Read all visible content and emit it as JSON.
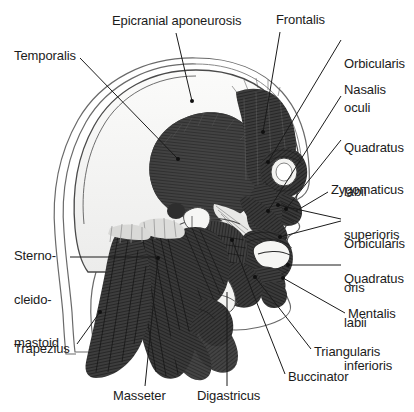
{
  "figure": {
    "view": "lateral",
    "background_color": "#ffffff",
    "ink_color": "#1b1b1b",
    "muscle_fill_dark": "#3a3a3a",
    "muscle_fill_mid": "#6e6e6e",
    "bone_fill": "#f2f2f0",
    "skin_outline_color": "#5a5a5a"
  },
  "labels": [
    {
      "id": "epicranial-aponeurosis",
      "text": "Epicranial aponeurosis",
      "lines": [
        "Epicranial aponeurosis"
      ],
      "x": 112,
      "y": 14,
      "align": "left",
      "leader": {
        "x1": 176,
        "y1": 33,
        "x2": 192,
        "y2": 101
      }
    },
    {
      "id": "frontalis",
      "text": "Frontalis",
      "lines": [
        "Frontalis"
      ],
      "x": 276,
      "y": 13,
      "align": "left",
      "leader": {
        "x1": 280,
        "y1": 32,
        "x2": 263,
        "y2": 132
      }
    },
    {
      "id": "orbicularis-oculi",
      "text": "Orbicularis oculi",
      "lines": [
        "Orbicularis",
        "oculi"
      ],
      "x": 344,
      "y": 28,
      "align": "left",
      "leader": {
        "x1": 341,
        "y1": 40,
        "x2": 268,
        "y2": 162
      }
    },
    {
      "id": "nasalis",
      "text": "Nasalis",
      "lines": [
        "Nasalis"
      ],
      "x": 344,
      "y": 83,
      "align": "left",
      "leader": {
        "x1": 341,
        "y1": 96,
        "x2": 268,
        "y2": 211
      }
    },
    {
      "id": "quadratus-labii-superioris",
      "text": "Quadratus labii superioris",
      "lines": [
        "Quadratus",
        "labii",
        "superioris"
      ],
      "x": 344,
      "y": 112,
      "align": "left",
      "leader": {
        "x1": 341,
        "y1": 140,
        "x2": 286,
        "y2": 209
      }
    },
    {
      "id": "zygomaticus",
      "text": "Zygomaticus",
      "lines": [
        "Zygomaticus"
      ],
      "x": 331,
      "y": 183,
      "align": "left",
      "leader": {
        "x1": 328,
        "y1": 192,
        "x2": 296,
        "y2": 211
      }
    },
    {
      "id": "orbicularis-oris",
      "text": "Orbicularis oris",
      "lines": [
        "Orbicularis",
        "oris"
      ],
      "x": 344,
      "y": 208,
      "align": "left",
      "leader": {
        "x1": 341,
        "y1": 220,
        "x2": 278,
        "y2": 205
      },
      "leader2": {
        "x1": 341,
        "y1": 222,
        "x2": 280,
        "y2": 236
      }
    },
    {
      "id": "quadratus-labii-inferioris",
      "text": "Quadratus labii inferioris",
      "lines": [
        "Quadratus",
        "labii",
        "inferioris"
      ],
      "x": 344,
      "y": 243,
      "align": "left",
      "leader": {
        "x1": 341,
        "y1": 265,
        "x2": 288,
        "y2": 265
      }
    },
    {
      "id": "mentalis",
      "text": "Mentalis",
      "lines": [
        "Mentalis"
      ],
      "x": 348,
      "y": 307,
      "align": "left",
      "leader": {
        "x1": 345,
        "y1": 315,
        "x2": 283,
        "y2": 278
      }
    },
    {
      "id": "triangularis",
      "text": "Triangularis",
      "lines": [
        "Triangularis"
      ],
      "x": 314,
      "y": 345,
      "align": "left",
      "leader": {
        "x1": 311,
        "y1": 351,
        "x2": 255,
        "y2": 277
      }
    },
    {
      "id": "buccinator",
      "text": "Buccinator",
      "lines": [
        "Buccinator"
      ],
      "x": 288,
      "y": 370,
      "align": "left",
      "leader": {
        "x1": 285,
        "y1": 376,
        "x2": 232,
        "y2": 240
      }
    },
    {
      "id": "digastricus",
      "text": "Digastricus",
      "lines": [
        "Digastricus"
      ],
      "x": 197,
      "y": 389,
      "align": "left",
      "leader": {
        "x1": 227,
        "y1": 388,
        "x2": 227,
        "y2": 292
      }
    },
    {
      "id": "masseter",
      "text": "Masseter",
      "lines": [
        "Masseter"
      ],
      "x": 113,
      "y": 389,
      "align": "left",
      "leader": {
        "x1": 145,
        "y1": 386,
        "x2": 158,
        "y2": 258
      }
    },
    {
      "id": "trapezius",
      "text": "Trapezius",
      "lines": [
        "Trapezius"
      ],
      "x": 14,
      "y": 342,
      "align": "left",
      "leader": {
        "x1": 77,
        "y1": 346,
        "x2": 100,
        "y2": 312
      }
    },
    {
      "id": "sternocleidomastoid",
      "text": "Sternocleidomastoid",
      "lines": [
        "Sterno-",
        "cleido-",
        "mastoid"
      ],
      "x": 14,
      "y": 220,
      "align": "left",
      "leader": {
        "x1": 70,
        "y1": 257,
        "x2": 158,
        "y2": 257
      }
    },
    {
      "id": "temporalis",
      "text": "Temporalis",
      "lines": [
        "Temporalis"
      ],
      "x": 14,
      "y": 49,
      "align": "left",
      "leader": {
        "x1": 80,
        "y1": 58,
        "x2": 178,
        "y2": 159
      }
    }
  ],
  "muscle_regions": [
    {
      "id": "temporalis-belly",
      "name": "Temporalis",
      "shape": "fan"
    },
    {
      "id": "frontalis-belly",
      "name": "Frontalis",
      "shape": "vertical-fibers"
    },
    {
      "id": "orbicularis-oculi-ring",
      "name": "Orbicularis oculi",
      "shape": "ring"
    },
    {
      "id": "orbicularis-oris-ring",
      "name": "Orbicularis oris",
      "shape": "ring"
    },
    {
      "id": "masseter-belly",
      "name": "Masseter",
      "shape": "quadrilateral"
    },
    {
      "id": "sternocleidomastoid-belly",
      "name": "Sternocleidomastoid",
      "shape": "strap"
    },
    {
      "id": "trapezius-belly",
      "name": "Trapezius",
      "shape": "triangular"
    },
    {
      "id": "digastricus-belly",
      "name": "Digastricus",
      "shape": "two-bellied"
    },
    {
      "id": "buccinator-belly",
      "name": "Buccinator",
      "shape": "flat"
    }
  ]
}
